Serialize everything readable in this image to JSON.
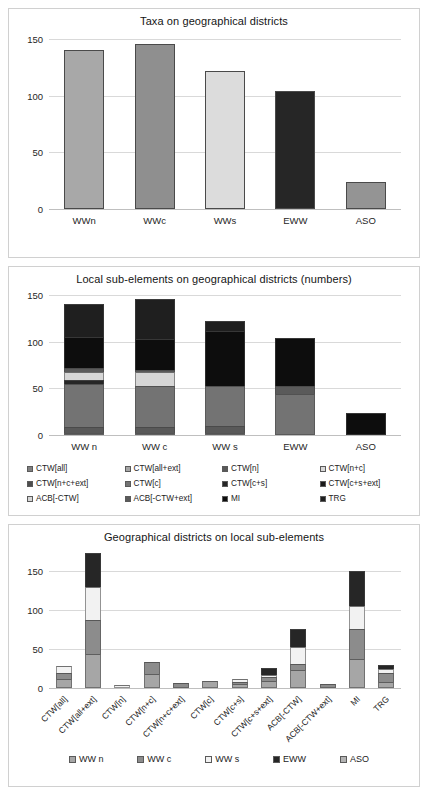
{
  "palette": {
    "ctw_all": "#808080",
    "ctw_all_ext": "#a6a6a6",
    "ctw_n": "#595959",
    "ctw_n_c": "#d9d9d9",
    "ctw_n_c_ext": "#4d4d4d",
    "ctw_c": "#737373",
    "ctw_c_s": "#262626",
    "ctw_c_s_ext": "#1a1a1a",
    "acb_ctw": "#0d0d0d",
    "acb_ctw_ext": "#404040",
    "mi": "#111111",
    "trg": "#1f1f1f",
    "ww_n": "#a6a6a6",
    "ww_c": "#8c8c8c",
    "ww_s": "#f2f2f2",
    "eww": "#262626",
    "aso": "#b3b3b3",
    "bar_wwn": "#a8a8a8",
    "bar_wwc": "#8f8f8f",
    "bar_wws": "#dcdcdc",
    "bar_eww": "#262626",
    "bar_aso": "#949494",
    "gridline": "#d9d9d9",
    "axis": "#bfbfbf",
    "panel_border": "#d0d0d0",
    "text": "#1a1a1a"
  },
  "chart_data": [
    {
      "type": "bar",
      "title": "Taxa on geographical districts",
      "xlabel": "",
      "ylabel": "",
      "categories": [
        "WWn",
        "WWc",
        "WWs",
        "EWW",
        "ASO"
      ],
      "values": [
        140,
        146,
        122,
        104,
        24
      ],
      "bar_colors": [
        "#a8a8a8",
        "#8f8f8f",
        "#dcdcdc",
        "#262626",
        "#949494"
      ],
      "ylim": [
        0,
        150
      ],
      "yticks": [
        0,
        50,
        100,
        150
      ],
      "grid": true,
      "legend": "none"
    },
    {
      "type": "bar",
      "stacked": true,
      "title": "Local sub-elements on geographical districts (numbers)",
      "xlabel": "",
      "ylabel": "",
      "categories": [
        "WW n",
        "WW c",
        "WW s",
        "EWW",
        "ASO"
      ],
      "ylim": [
        0,
        150
      ],
      "yticks": [
        0,
        50,
        100,
        150
      ],
      "grid": true,
      "legend": "bottom",
      "series": [
        {
          "name": "CTW[all]",
          "color": "#808080",
          "values": [
            2,
            2,
            2,
            0,
            0
          ]
        },
        {
          "name": "CTW[all+ext]",
          "color": "#a6a6a6",
          "values": [
            0,
            0,
            0,
            0,
            0
          ]
        },
        {
          "name": "CTW[n]",
          "color": "#595959",
          "values": [
            7,
            7,
            8,
            0,
            0
          ]
        },
        {
          "name": "CTW[n+c]",
          "color": "#d9d9d9",
          "values": [
            0,
            0,
            0,
            0,
            0
          ]
        },
        {
          "name": "CTW[n+c+ext]",
          "color": "#4d4d4d",
          "values": [
            0,
            0,
            0,
            0,
            0
          ]
        },
        {
          "name": "CTW[c]",
          "color": "#737373",
          "values": [
            46,
            43,
            42,
            44,
            0
          ]
        },
        {
          "name": "CTW[c+s]",
          "color": "#262626",
          "values": [
            4,
            0,
            0,
            0,
            0
          ]
        },
        {
          "name": "CTW[c+s+ext]",
          "color": "#1a1a1a",
          "values": [
            0,
            0,
            0,
            0,
            0
          ]
        },
        {
          "name": "ACB[-CTW]",
          "color": "#d6d6d6",
          "values": [
            8,
            15,
            0,
            0,
            0
          ]
        },
        {
          "name": "ACB[-CTW+ext]",
          "color": "#5a5a5a",
          "values": [
            5,
            3,
            0,
            9,
            0
          ]
        },
        {
          "name": "MI",
          "color": "#0d0d0d",
          "values": [
            33,
            33,
            59,
            51,
            24
          ]
        },
        {
          "name": "TRG",
          "color": "#1f1f1f",
          "values": [
            35,
            43,
            11,
            0,
            0
          ]
        }
      ]
    },
    {
      "type": "bar",
      "stacked": true,
      "title": "Geographical districts on local sub-elements",
      "xlabel": "",
      "ylabel": "",
      "categories": [
        "CTW[all]",
        "CTW[all+ext]",
        "CTW[n]",
        "CTW[n+c]",
        "CTW[n+c+ext]",
        "CTW[c]",
        "CTW[c+s]",
        "CTW[c+s+ext]",
        "ACB[-CTW]",
        "ACB[-CTW+ext]",
        "MI",
        "TRG"
      ],
      "ylim": [
        0,
        175
      ],
      "yticks": [
        0,
        50,
        100,
        150
      ],
      "grid": true,
      "legend": "bottom",
      "series": [
        {
          "name": "WW n",
          "color": "#a6a6a6",
          "values": [
            11,
            44,
            0,
            18,
            0,
            9,
            5,
            9,
            23,
            0,
            37,
            8
          ]
        },
        {
          "name": "WW c",
          "color": "#8c8c8c",
          "values": [
            8,
            43,
            0,
            15,
            7,
            0,
            3,
            5,
            8,
            5,
            39,
            11
          ]
        },
        {
          "name": "WW s",
          "color": "#f2f2f2",
          "values": [
            9,
            42,
            4,
            0,
            0,
            0,
            4,
            3,
            21,
            0,
            29,
            5
          ]
        },
        {
          "name": "EWW",
          "color": "#262626",
          "values": [
            0,
            44,
            0,
            0,
            0,
            0,
            0,
            9,
            23,
            0,
            44,
            5
          ]
        },
        {
          "name": "ASO",
          "color": "#b3b3b3",
          "values": [
            0,
            0,
            0,
            0,
            0,
            0,
            0,
            0,
            0,
            0,
            0,
            0
          ]
        }
      ]
    }
  ]
}
